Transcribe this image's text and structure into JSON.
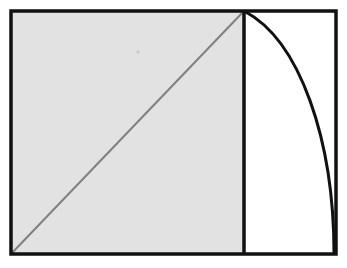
{
  "figure": {
    "title": "Square with diagonal and circular arc",
    "type": "geometric-diagram",
    "canvas": {
      "width": 347,
      "height": 268,
      "background": "#ffffff"
    },
    "colors": {
      "outline": "#111111",
      "square_fill": "#e2e2e2",
      "diagonal_stroke": "#808080",
      "arc_stroke": "#111111",
      "right_region_fill": "#ffffff"
    },
    "outer_rectangle": {
      "name": "outer-rectangle",
      "x": 11,
      "y": 11,
      "width": 325,
      "height": 243,
      "stroke": "#111111",
      "stroke_width": 3.5,
      "fill": "none"
    },
    "shaded_square": {
      "name": "shaded-square",
      "x": 11,
      "y": 11,
      "width": 233,
      "height": 243,
      "fill": "#e2e2e2",
      "label": "shaded square region"
    },
    "divider_line": {
      "name": "vertical-divider",
      "x1": 244,
      "y1": 11,
      "x2": 244,
      "y2": 254,
      "stroke": "#111111",
      "stroke_width": 3.5
    },
    "diagonal_line": {
      "name": "square-diagonal",
      "x1": 11,
      "y1": 254,
      "x2": 244,
      "y2": 11,
      "stroke": "#808080",
      "stroke_width": 2,
      "label": "diagonal of the square"
    },
    "arc": {
      "name": "circular-arc",
      "start_x": 244,
      "start_y": 11,
      "end_x": 334,
      "end_y": 254,
      "control_x": 300,
      "control_y": 40,
      "control2_x": 334,
      "control2_y": 140,
      "stroke": "#111111",
      "stroke_width": 3,
      "fill": "none",
      "label": "arc bulging to the right"
    },
    "right_region": {
      "name": "right-white-region",
      "fill": "#ffffff",
      "label": "unshaded region between divider and arc"
    },
    "artifact_dot": {
      "name": "scan-artifact-dot",
      "cx": 138,
      "cy": 52,
      "r": 1.6,
      "fill": "#c9c9c9"
    }
  }
}
